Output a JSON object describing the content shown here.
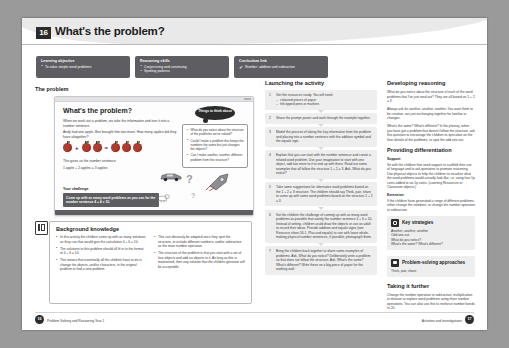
{
  "unit": {
    "number": "16",
    "title": "What's the problem?"
  },
  "info_boxes": [
    {
      "heading": "Learning objective",
      "items": [
        "To solve simple word problems"
      ]
    },
    {
      "heading": "Reasoning skills",
      "items": [
        "Conjecturing and convincing",
        "Spotting patterns"
      ]
    },
    {
      "heading": "Curriculum link",
      "items": [
        "Number: addition and subtraction"
      ]
    }
  ],
  "problem_section": {
    "label": "The problem",
    "panel": {
      "title": "What's the problem?",
      "intro": "When we work out a problem, we take the information and turn it into a number sentence.",
      "question": "Andy had one apple. Ben brought him two more. How many apples did they have altogether?",
      "number_sentence_label": "This gives us the number sentence:",
      "number_sentence": "1 apple + 2 apples = 3 apples",
      "equation": {
        "left_count": 1,
        "middle_count": 2,
        "right_count": 3,
        "operator": "+",
        "equals": "="
      },
      "challenge_heading": "Your challenge",
      "challenge_text": "Come up with as many word problems as you can for the number sentence 4 + 4 = 10.",
      "bubble_title": "Things to think about",
      "bubble_items": [
        "What do you notice about the structure of the problems we've solved?",
        "Could I make a problem that keeps the numbers the same but just changes the objects?",
        "Can I make another, another, different problem from this structure?"
      ]
    }
  },
  "background": {
    "heading": "Background knowledge",
    "column1": [
      "In this activity the children come up with as many solutions as they can that would give the calculation 4 + 6 = 10.",
      "The solutions to this problem should all fit in to the format of 4 + 6 = 10.",
      "This means that essentially all the children have to do is change the objects, and/or characters, in the original problem to find a new problem."
    ],
    "column2": [
      "This can obviously be adapted once they spot the structure, to include different numbers, and/or subtraction as the main number operation.",
      "The structure of the problem is that you start with a set of four objects and add six objects to it. As long as this is maintained, then any solution that the children generate will be acceptable."
    ]
  },
  "launching": {
    "heading": "Launching the activity",
    "steps": [
      {
        "number": "1",
        "text": "Get the resources ready. You will need:",
        "subitems": [
          "coloured pieces of paper",
          "felt-tipped pens or markers"
        ]
      },
      {
        "number": "2",
        "text": "Share the prompt poster and work through the example together."
      },
      {
        "number": "3",
        "text": "Model the process of taking the key information from the problem and placing into a number sentence with the addition symbol and the equals sign."
      },
      {
        "number": "4",
        "text": "Explain that you can start with the number sentence and create a related word problem. Use your imagination to start with one object, add two more to it to end up with three. Read out some examples that all follow the structure 1 + 2 = 3. Ask, What do you notice?"
      },
      {
        "number": "5",
        "text": "Take some suggestions for alternative word problems based on the 1 + 2 = 3 structure. The children should say Think, pair, share to come up with some word problems based on the structure 1 + 2 = 3."
      },
      {
        "number": "6",
        "text": "Set the children the challenge of coming up with as many word problems as possible that satisfy the number sentence 4 + 6 = 10. Instead of writing, children could draw the objects or use an adult to record their ideas. Provide addition and equals signs (see Resource sheet 16.1, Plus and equals) to use with loose whole-making physical number sentences, if possible, photograph them."
      },
      {
        "number": "7",
        "text": "Bring the children back together to share some examples of problems. Ask, What do you notice? Deliberately write a problem so that does not follow the structure. Ask, What's the same? What's different? Write these on a big piece of paper for the working wall."
      }
    ]
  },
  "reasoning": {
    "heading": "Developing reasoning",
    "paragraphs": [
      "What do you notice about the structure of each of the word problems that I've just read out? They are all based on 1 + 2 = 3.",
      "Always ask for another, another, another. You want them to be creative, not just exchanging together for familiar or changes.",
      "What's the same? What's different? In the plenary, when you have got a problem that doesn't follow the structure, ask this question to encourage the children to speculate on the finer details of the problems, to spot the odd one out."
    ]
  },
  "differentiation": {
    "heading": "Providing differentiation",
    "support_heading": "Support",
    "support_text": "Sit with the children that need support to scaffold their use of language and to ask questions to promote reasoning. Use physical objects to help the children to visualise what the word problems would actually look like, i.e. using four 1p coins added to six 1p coins. (counting Resources or Classroom objects.)",
    "extension_heading": "Extension",
    "extension_text": "If the children have generated a range of different problems, either change the numbers, or change the number operation to subtraction."
  },
  "key_strategies": {
    "heading": "Key strategies",
    "items": [
      "Another, another, another",
      "Odd one out",
      "What do you notice?",
      "What's the same? What's different?"
    ]
  },
  "approaches": {
    "heading": "Problem-solving approaches",
    "items": [
      "Think, pair, share"
    ]
  },
  "taking_further": {
    "heading": "Taking it further",
    "text": "Change the number operation to subtraction, multiplication or division to explore word problems using three number operations. You can also use this to reinforce number bonds to 20."
  },
  "footer": {
    "left_page": "16",
    "left_text": "Problem Solving and Reasoning Year 1",
    "right_page": "17",
    "right_text": "Activities and investigations"
  }
}
